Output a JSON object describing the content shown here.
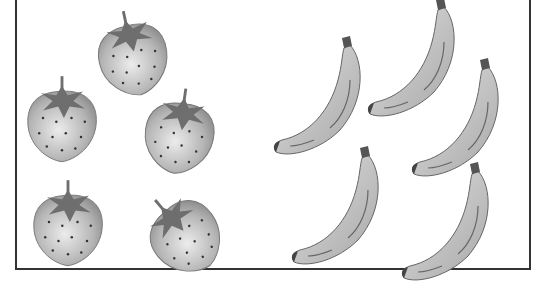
{
  "scene": {
    "description": "Grouping illustration",
    "groups": [
      {
        "name": "strawberries",
        "count": 5
      },
      {
        "name": "bananas",
        "count": 5
      }
    ],
    "colors": {
      "border": "#333333",
      "fruit_fill": "#bdbdbd",
      "leaf": "#6e6e6e",
      "outline": "#555555"
    }
  }
}
